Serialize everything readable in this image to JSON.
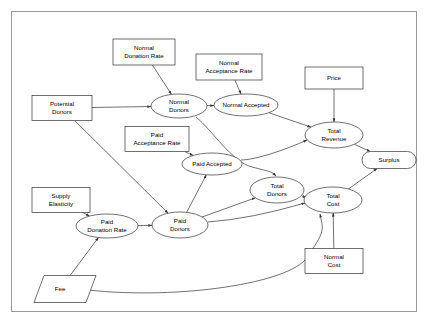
{
  "diagram": {
    "frame": {
      "x": 11,
      "y": 11,
      "width": 406,
      "height": 301
    },
    "colors": {
      "background": "#ffffff",
      "stroke": "#333333",
      "frame_stroke": "#9a9a9a",
      "node_fill": "#ffffff",
      "text": "#000000"
    },
    "nodes": [
      {
        "id": "normal_donation_rate",
        "label_lines": [
          "Normal",
          "Donation Rate"
        ],
        "shape": "rectangle",
        "cx": 144,
        "cy": 52,
        "w": 62,
        "h": 26
      },
      {
        "id": "normal_acceptance_rate",
        "label_lines": [
          "Normal",
          "Acceptance Rate"
        ],
        "shape": "rectangle",
        "cx": 229,
        "cy": 67,
        "w": 66,
        "h": 26
      },
      {
        "id": "price",
        "label_lines": [
          "Price"
        ],
        "shape": "rectangle",
        "cx": 334,
        "cy": 78,
        "w": 58,
        "h": 22
      },
      {
        "id": "potential_donors",
        "label_lines": [
          "Potential",
          "Donors"
        ],
        "shape": "rectangle",
        "cx": 62,
        "cy": 108,
        "w": 60,
        "h": 25
      },
      {
        "id": "paid_acceptance_rate",
        "label_lines": [
          "Paid",
          "Acceptance Rate"
        ],
        "shape": "rectangle",
        "cx": 157,
        "cy": 139,
        "w": 64,
        "h": 25
      },
      {
        "id": "supply_elasticity",
        "label_lines": [
          "Supply",
          "Elasticity"
        ],
        "shape": "rectangle",
        "cx": 61,
        "cy": 200,
        "w": 58,
        "h": 25
      },
      {
        "id": "normal_cost",
        "label_lines": [
          "Normal",
          "Cost"
        ],
        "shape": "rectangle",
        "cx": 334,
        "cy": 261,
        "w": 58,
        "h": 25
      },
      {
        "id": "normal_donors",
        "label_lines": [
          "Normal",
          "Donors"
        ],
        "shape": "ellipse",
        "cx": 179,
        "cy": 106,
        "rx": 28,
        "ry": 12
      },
      {
        "id": "normal_accepted",
        "label_lines": [
          "Normal Accepted"
        ],
        "shape": "ellipse",
        "cx": 246,
        "cy": 105,
        "rx": 32,
        "ry": 11
      },
      {
        "id": "total_revenue",
        "label_lines": [
          "Total",
          "Revenue"
        ],
        "shape": "ellipse",
        "cx": 334,
        "cy": 135,
        "rx": 29,
        "ry": 13
      },
      {
        "id": "paid_accepted",
        "label_lines": [
          "Paid Accepted"
        ],
        "shape": "ellipse",
        "cx": 212,
        "cy": 164,
        "rx": 30,
        "ry": 11
      },
      {
        "id": "total_donors",
        "label_lines": [
          "Total",
          "Donors"
        ],
        "shape": "ellipse",
        "cx": 277,
        "cy": 190,
        "rx": 27,
        "ry": 13
      },
      {
        "id": "total_cost",
        "label_lines": [
          "Total",
          "Cost"
        ],
        "shape": "ellipse",
        "cx": 333,
        "cy": 200,
        "rx": 29,
        "ry": 13
      },
      {
        "id": "paid_donation_rate",
        "label_lines": [
          "Paid",
          "Donation Rate"
        ],
        "shape": "ellipse",
        "cx": 107,
        "cy": 226,
        "rx": 31,
        "ry": 12
      },
      {
        "id": "paid_donors",
        "label_lines": [
          "Paid",
          "Donors"
        ],
        "shape": "ellipse",
        "cx": 180,
        "cy": 225,
        "rx": 28,
        "ry": 13
      },
      {
        "id": "surplus",
        "label_lines": [
          "Surplus"
        ],
        "shape": "stadium",
        "cx": 389,
        "cy": 160,
        "w": 54,
        "h": 17
      },
      {
        "id": "fee",
        "label_lines": [
          "Fee"
        ],
        "shape": "parallelogram",
        "cx": 60,
        "cy": 289,
        "w": 52,
        "h": 27,
        "skew": 10
      }
    ],
    "edges": [
      {
        "from": "normal_donation_rate",
        "to": "normal_donors"
      },
      {
        "from": "normal_acceptance_rate",
        "to": "normal_accepted"
      },
      {
        "from": "price",
        "to": "total_revenue"
      },
      {
        "from": "potential_donors",
        "to": "normal_donors"
      },
      {
        "from": "potential_donors",
        "to": "paid_donors"
      },
      {
        "from": "normal_donors",
        "to": "normal_accepted"
      },
      {
        "from": "normal_donors",
        "to": "total_donors"
      },
      {
        "from": "normal_accepted",
        "to": "total_revenue"
      },
      {
        "from": "paid_acceptance_rate",
        "to": "paid_accepted"
      },
      {
        "from": "paid_accepted",
        "to": "total_revenue"
      },
      {
        "from": "paid_donors",
        "to": "paid_accepted"
      },
      {
        "from": "paid_donors",
        "to": "total_donors"
      },
      {
        "from": "paid_donors",
        "to": "total_cost"
      },
      {
        "from": "supply_elasticity",
        "to": "paid_donation_rate"
      },
      {
        "from": "fee",
        "to": "paid_donation_rate"
      },
      {
        "from": "fee",
        "to": "total_cost"
      },
      {
        "from": "paid_donation_rate",
        "to": "paid_donors"
      },
      {
        "from": "total_donors",
        "to": "total_cost"
      },
      {
        "from": "normal_cost",
        "to": "total_cost"
      },
      {
        "from": "total_revenue",
        "to": "surplus"
      },
      {
        "from": "total_cost",
        "to": "surplus"
      }
    ]
  }
}
